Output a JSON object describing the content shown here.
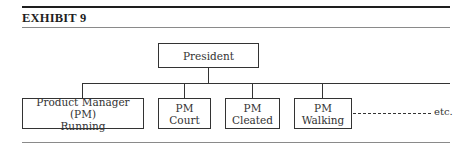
{
  "exhibit": {
    "title": "EXHIBIT 9"
  },
  "org_chart": {
    "root": {
      "label": "President"
    },
    "children": [
      {
        "line1": "Product Manager (PM)",
        "line2": "Running"
      },
      {
        "line1": "PM",
        "line2": "Court"
      },
      {
        "line1": "PM",
        "line2": "Cleated"
      },
      {
        "line1": "PM",
        "line2": "Walking"
      }
    ],
    "continuation_label": "etc."
  }
}
